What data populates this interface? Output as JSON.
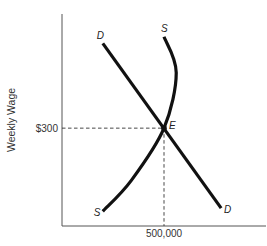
{
  "chart_data": {
    "type": "line",
    "title": "",
    "xlabel": "",
    "ylabel": "Weekly Wage",
    "grid": false,
    "legend": "none",
    "x_ticks": [
      {
        "value": 500000,
        "label": "500,000"
      }
    ],
    "y_ticks": [
      {
        "value": 300,
        "label": "$300"
      }
    ],
    "series": [
      {
        "name": "Demand",
        "label": "D",
        "shape": "downward-sloping straight line",
        "points": [
          [
            200000,
            560
          ],
          [
            500000,
            300
          ],
          [
            780000,
            55
          ]
        ]
      },
      {
        "name": "Supply",
        "label": "S",
        "shape": "upward-sloping curve, bending back near top",
        "points": [
          [
            200000,
            45
          ],
          [
            340000,
            140
          ],
          [
            500000,
            300
          ],
          [
            560000,
            470
          ],
          [
            500000,
            580
          ]
        ]
      }
    ],
    "equilibrium": {
      "label": "E",
      "x": 500000,
      "y": 300,
      "x_label": "500,000",
      "y_label": "$300"
    },
    "annotations": [
      "D",
      "S",
      "E",
      "S",
      "D"
    ]
  }
}
